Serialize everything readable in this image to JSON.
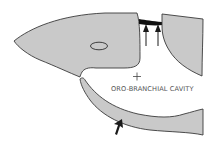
{
  "diagram": {
    "type": "anatomical-schematic",
    "labels": {
      "cavity": "ORO-BRANCHIAL CAVITY"
    },
    "parts": [
      {
        "name": "upper-head",
        "description": "Head / upper jaw shape with eye"
      },
      {
        "name": "eye",
        "description": "Small oval eye"
      },
      {
        "name": "dark-band",
        "description": "Dark connecting band between head and operculum"
      },
      {
        "name": "operculum",
        "description": "Right opercular flap"
      },
      {
        "name": "lower-jaw",
        "description": "Lower jaw / floor of cavity"
      }
    ],
    "markers": [
      {
        "name": "up-arrow-left",
        "direction": "up"
      },
      {
        "name": "up-arrow-right",
        "direction": "up"
      },
      {
        "name": "bottom-arrow",
        "direction": "up-right"
      },
      {
        "name": "plus-marker",
        "symbol": "+"
      }
    ],
    "colors": {
      "fill": "#c9c9c9",
      "outline": "#3a3a3a",
      "band": "#111111",
      "text": "#555555",
      "background": "#ffffff"
    }
  }
}
